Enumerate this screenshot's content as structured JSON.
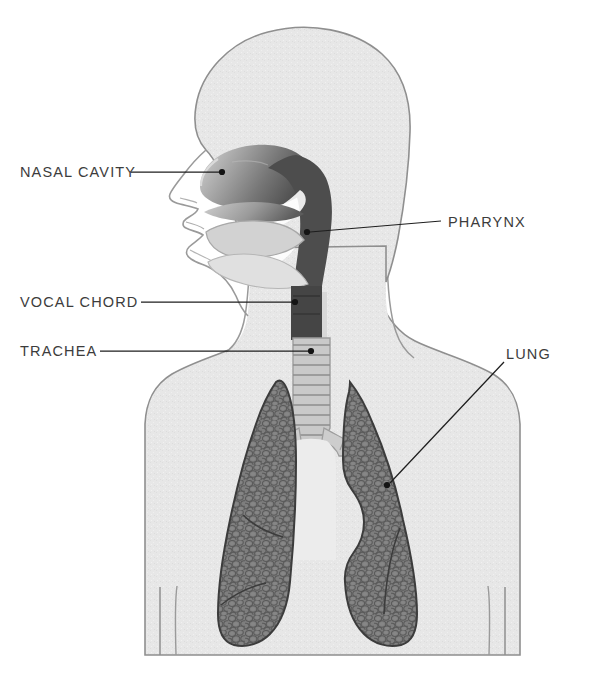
{
  "diagram": {
    "background_color": "#ffffff",
    "label_color": "#3c3c3c",
    "leader_line_color": "#1e1e1e",
    "body_fill": "#e7e7e7",
    "body_outline": "#8f8f8f",
    "airway_dark": "#4d4d4d",
    "lung_fill": "#7e7e7e",
    "lung_outline": "#3c3c3c",
    "trachea_fill": "#c9c9c9"
  },
  "labels": [
    {
      "id": "nasal-cavity",
      "text": "NASAL CAVITY",
      "text_x": 20,
      "text_y": 165,
      "leader": {
        "x1": 131,
        "y1": 172,
        "x2": 219,
        "y2": 172
      },
      "dot": {
        "x": 222,
        "y": 172
      }
    },
    {
      "id": "pharynx",
      "text": "PHARYNX",
      "text_x": 448,
      "text_y": 215,
      "leader": {
        "x1": 441,
        "y1": 221,
        "x2": 310,
        "y2": 232
      },
      "dot": {
        "x": 307,
        "y": 232
      }
    },
    {
      "id": "vocal-chord",
      "text": "VOCAL CHORD",
      "text_x": 20,
      "text_y": 295,
      "leader": {
        "x1": 141,
        "y1": 302,
        "x2": 292,
        "y2": 302
      },
      "dot": {
        "x": 295,
        "y": 302
      }
    },
    {
      "id": "trachea",
      "text": "TRACHEA",
      "text_x": 20,
      "text_y": 344,
      "leader": {
        "x1": 100,
        "y1": 351,
        "x2": 308,
        "y2": 351
      },
      "dot": {
        "x": 311,
        "y": 351
      }
    },
    {
      "id": "lung",
      "text": "LUNG",
      "text_x": 506,
      "text_y": 347,
      "leader": {
        "x1": 504,
        "y1": 362,
        "x2": 390,
        "y2": 483
      },
      "dot": {
        "x": 387,
        "y": 485
      }
    }
  ],
  "anatomy_parts": [
    {
      "name": "head",
      "label": "Head outline"
    },
    {
      "name": "nasal-cavity",
      "label": "Nasal cavity"
    },
    {
      "name": "oral-cavity",
      "label": "Oral cavity / tongue"
    },
    {
      "name": "pharynx",
      "label": "Pharynx"
    },
    {
      "name": "larynx",
      "label": "Vocal chord / larynx"
    },
    {
      "name": "trachea",
      "label": "Trachea"
    },
    {
      "name": "bronchi",
      "label": "Bronchi"
    },
    {
      "name": "left-lung",
      "label": "Lung (left of image)"
    },
    {
      "name": "right-lung",
      "label": "Lung (right of image)"
    },
    {
      "name": "torso",
      "label": "Torso / shoulders"
    }
  ]
}
